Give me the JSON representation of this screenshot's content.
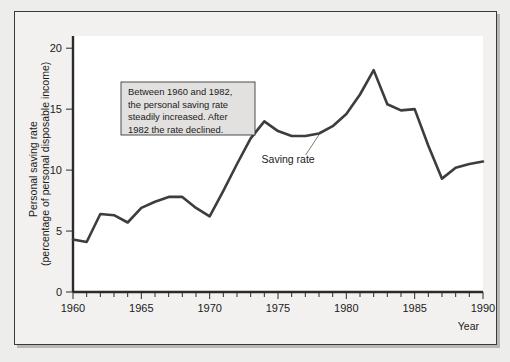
{
  "figure": {
    "background_color": "#f2f1f0",
    "plot_background_color": "#ffffff",
    "line_color": "#3d3d3d",
    "axis_color": "#2b2b2b"
  },
  "annotation": {
    "line1": "Between 1960 and 1982,",
    "line2": "the personal saving rate",
    "line3": "steadily increased. After",
    "line4": "1982 the rate declined."
  },
  "series_callout": {
    "label": "Saving rate"
  },
  "axis_titles": {
    "y_line1": "Personal saving rate",
    "y_line2": "(percentage of personal disposable income)",
    "x": "Year"
  },
  "y_ticks": [
    {
      "value": 0,
      "label": "0"
    },
    {
      "value": 5,
      "label": "5"
    },
    {
      "value": 10,
      "label": "10"
    },
    {
      "value": 15,
      "label": "15"
    },
    {
      "value": 20,
      "label": "20"
    }
  ],
  "x_ticks": [
    {
      "value": 1960,
      "label": "1960"
    },
    {
      "value": 1965,
      "label": "1965"
    },
    {
      "value": 1970,
      "label": "1970"
    },
    {
      "value": 1975,
      "label": "1975"
    },
    {
      "value": 1980,
      "label": "1980"
    },
    {
      "value": 1985,
      "label": "1985"
    },
    {
      "value": 1990,
      "label": "1990"
    }
  ],
  "chart_data": {
    "type": "line",
    "title": "",
    "xlabel": "Year",
    "ylabel": "Personal saving rate (percentage of personal disposable income)",
    "xlim": [
      1960,
      1990
    ],
    "ylim": [
      0,
      21
    ],
    "grid": false,
    "legend_position": "none",
    "x_tick_interval": 5,
    "x_minor_tick_interval": 1,
    "y_tick_interval": 5,
    "annotations": [
      {
        "text": "Between 1960 and 1982, the personal saving rate steadily increased. After 1982 the rate declined.",
        "x": 1964.5,
        "y": 16.3
      },
      {
        "text": "Saving rate",
        "x": 1973.8,
        "y": 11.4,
        "points_to_x": 1978.0,
        "points_to_y": 12.9
      }
    ],
    "series": [
      {
        "name": "Saving rate",
        "x": [
          1960,
          1961,
          1962,
          1963,
          1964,
          1965,
          1966,
          1967,
          1968,
          1969,
          1970,
          1971,
          1972,
          1973,
          1974,
          1975,
          1976,
          1977,
          1978,
          1979,
          1980,
          1981,
          1982,
          1983,
          1984,
          1985,
          1986,
          1987,
          1988,
          1989,
          1990
        ],
        "values": [
          4.3,
          4.1,
          6.4,
          6.3,
          5.7,
          6.9,
          7.4,
          7.8,
          7.8,
          6.9,
          6.2,
          8.3,
          10.5,
          12.6,
          14.0,
          13.2,
          12.8,
          12.8,
          13.0,
          13.6,
          14.6,
          16.2,
          18.2,
          15.4,
          14.9,
          15.0,
          12.0,
          9.3,
          10.2,
          10.5,
          10.7
        ]
      }
    ]
  }
}
